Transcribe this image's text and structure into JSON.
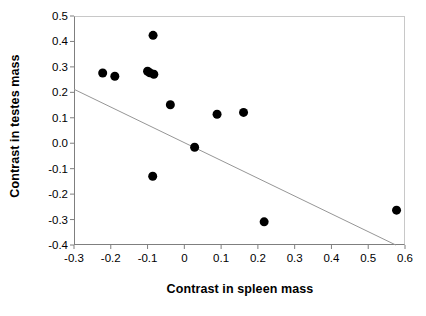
{
  "chart_data": {
    "type": "scatter",
    "title": "",
    "subtitle": "",
    "xlabel": "Contrast in spleen mass",
    "ylabel": "Contrast in testes mass",
    "xlim": [
      -0.3,
      0.6
    ],
    "ylim": [
      -0.4,
      0.5
    ],
    "xticks": [
      -0.3,
      -0.2,
      -0.1,
      0,
      0.1,
      0.2,
      0.3,
      0.4,
      0.5,
      0.6
    ],
    "xtick_labels": [
      "-0.3",
      "-0.2",
      "-0.1",
      "0",
      "0.1",
      "0.2",
      "0.3",
      "0.4",
      "0.5",
      "0.6"
    ],
    "yticks": [
      0.5,
      0.4,
      0.3,
      0.2,
      0.1,
      0.0,
      -0.1,
      -0.2,
      -0.3,
      -0.4
    ],
    "ytick_labels": [
      "0.5",
      "0.4",
      "0.3",
      "0.2",
      "0.1",
      "0.0",
      "-0.1",
      "-0.2",
      "-0.3",
      "-0.4"
    ],
    "grid": false,
    "legend": null,
    "marker": {
      "shape": "circle",
      "color": "#000000",
      "size_px": 9
    },
    "points": [
      {
        "x": -0.222,
        "y": 0.276
      },
      {
        "x": -0.189,
        "y": 0.263
      },
      {
        "x": -0.1,
        "y": 0.283
      },
      {
        "x": -0.094,
        "y": 0.277
      },
      {
        "x": -0.083,
        "y": 0.271
      },
      {
        "x": -0.085,
        "y": 0.424
      },
      {
        "x": -0.038,
        "y": 0.151
      },
      {
        "x": 0.089,
        "y": 0.114
      },
      {
        "x": 0.161,
        "y": 0.121
      },
      {
        "x": 0.028,
        "y": -0.016
      },
      {
        "x": -0.086,
        "y": -0.13
      },
      {
        "x": 0.217,
        "y": -0.309
      },
      {
        "x": 0.577,
        "y": -0.263
      }
    ],
    "trendline": {
      "type": "linear",
      "color": "#969696",
      "x_start": -0.3,
      "y_start": 0.212,
      "x_end": 0.575,
      "y_end": -0.4,
      "slope": -0.699,
      "intercept": 0.002
    }
  },
  "axes": {
    "y_title": "Contrast in testes mass",
    "x_title": "Contrast in spleen mass"
  }
}
